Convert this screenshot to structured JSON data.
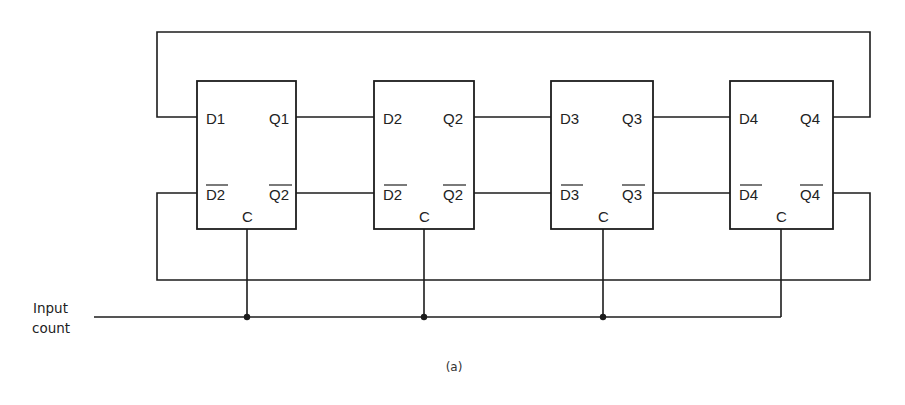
{
  "diagram": {
    "caption": "(a)",
    "input_label": {
      "line1": "Input",
      "line2": "count"
    },
    "flip_flops": [
      {
        "id": "ff1",
        "d_label": "D1",
        "q_label": "Q1",
        "dbar_label": "D2",
        "qbar_label": "Q2",
        "clock_label": "C"
      },
      {
        "id": "ff2",
        "d_label": "D2",
        "q_label": "Q2",
        "dbar_label": "D2",
        "qbar_label": "Q2",
        "clock_label": "C"
      },
      {
        "id": "ff3",
        "d_label": "D3",
        "q_label": "Q3",
        "dbar_label": "D3",
        "qbar_label": "Q3",
        "clock_label": "C"
      },
      {
        "id": "ff4",
        "d_label": "D4",
        "q_label": "Q4",
        "dbar_label": "D4",
        "qbar_label": "Q4",
        "clock_label": "C"
      }
    ],
    "connections": [
      "Q1 -> D2",
      "Q2 -> D3",
      "Q3 -> D4",
      "Q4 -> D1 (top feedback loop)",
      "Q1bar -> D2bar",
      "Q2bar -> D3bar",
      "Q3bar -> D4bar",
      "Q4bar -> D1bar (bottom feedback loop)",
      "Input count -> C of all four flip-flops"
    ],
    "colors": {
      "line": "#1c1c1c",
      "text": "#222222",
      "background": "#ffffff"
    }
  }
}
